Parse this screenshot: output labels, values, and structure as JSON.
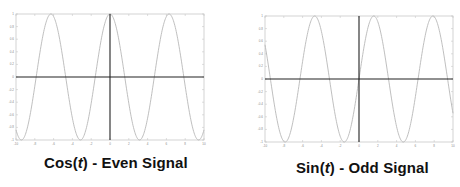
{
  "chart_data": [
    {
      "type": "line",
      "title": "Cos(t) - Even Signal",
      "title_parts": {
        "prefix": "Cos(",
        "var": "t",
        "suffix": ") - Even Signal"
      },
      "function": "cos",
      "xlabel": "",
      "ylabel": "",
      "xlim": [
        -10,
        10
      ],
      "ylim": [
        -1,
        1
      ],
      "x_ticks": [
        -10,
        -8,
        -6,
        -4,
        -2,
        0,
        2,
        4,
        6,
        8,
        10
      ],
      "y_ticks": [
        -1,
        -0.8,
        -0.6,
        -0.4,
        -0.2,
        0,
        0.2,
        0.4,
        0.6,
        0.8,
        1
      ],
      "grid": false,
      "legend": null,
      "series": [
        {
          "name": "cos(t)",
          "x": [
            -10,
            -9,
            -8,
            -7,
            -6,
            -5,
            -4,
            -3,
            -2,
            -1,
            0,
            1,
            2,
            3,
            4,
            5,
            6,
            7,
            8,
            9,
            10
          ],
          "values": [
            -0.84,
            -0.91,
            -0.15,
            0.75,
            0.96,
            0.28,
            -0.65,
            -0.99,
            -0.42,
            0.54,
            1.0,
            0.54,
            -0.42,
            -0.99,
            -0.65,
            0.28,
            0.96,
            0.75,
            -0.15,
            -0.91,
            -0.84
          ]
        }
      ]
    },
    {
      "type": "line",
      "title": "Sin(t) - Odd Signal",
      "title_parts": {
        "prefix": "Sin(",
        "var": "t",
        "suffix": ") - Odd Signal"
      },
      "function": "sin",
      "xlabel": "",
      "ylabel": "",
      "xlim": [
        -10,
        10
      ],
      "ylim": [
        -1,
        1
      ],
      "x_ticks": [
        -10,
        -8,
        -6,
        -4,
        -2,
        0,
        2,
        4,
        6,
        8,
        10
      ],
      "y_ticks": [
        -1,
        -0.8,
        -0.6,
        -0.4,
        -0.2,
        0,
        0.2,
        0.4,
        0.6,
        0.8,
        1
      ],
      "grid": false,
      "legend": null,
      "series": [
        {
          "name": "sin(t)",
          "x": [
            -10,
            -9,
            -8,
            -7,
            -6,
            -5,
            -4,
            -3,
            -2,
            -1,
            0,
            1,
            2,
            3,
            4,
            5,
            6,
            7,
            8,
            9,
            10
          ],
          "values": [
            0.54,
            -0.41,
            -0.99,
            -0.66,
            0.28,
            0.96,
            0.76,
            -0.14,
            -0.91,
            -0.84,
            0.0,
            0.84,
            0.91,
            0.14,
            -0.76,
            -0.96,
            -0.28,
            0.66,
            0.99,
            0.41,
            -0.54
          ]
        }
      ]
    }
  ],
  "style": {
    "curve_color": "#b8b8b8",
    "axis_color": "#222222",
    "box_color": "#c8c8c8",
    "caption_color": "#111111"
  },
  "layout": {
    "panels": [
      {
        "box": {
          "x": 16,
          "y": 14,
          "w": 188,
          "h": 126
        },
        "caption": {
          "x": 44,
          "y": 154
        }
      },
      {
        "box": {
          "x": 265,
          "y": 16,
          "w": 188,
          "h": 126
        },
        "caption": {
          "x": 296,
          "y": 159
        }
      }
    ]
  }
}
